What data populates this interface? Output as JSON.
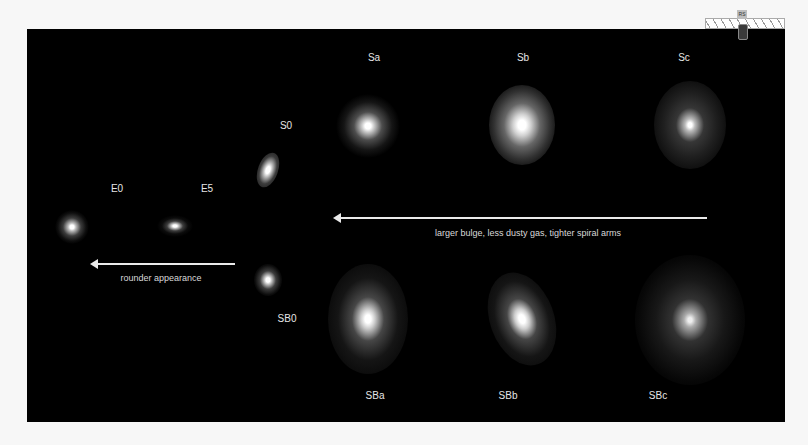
{
  "diagram": {
    "labels": {
      "E0": "E0",
      "E5": "E5",
      "S0": "S0",
      "SB0": "SB0",
      "Sa": "Sa",
      "Sb": "Sb",
      "Sc": "Sc",
      "SBa": "SBa",
      "SBb": "SBb",
      "SBc": "SBc"
    },
    "arrows": {
      "spiral_trend": "larger bulge, less dusty gas, tighter spiral arms",
      "elliptical_trend": "rounder appearance"
    },
    "colors": {
      "background": "#000000",
      "text": "#e6e6e6",
      "arrow": "#eaeaea"
    }
  },
  "overlay": {
    "tab_label": "RS"
  }
}
